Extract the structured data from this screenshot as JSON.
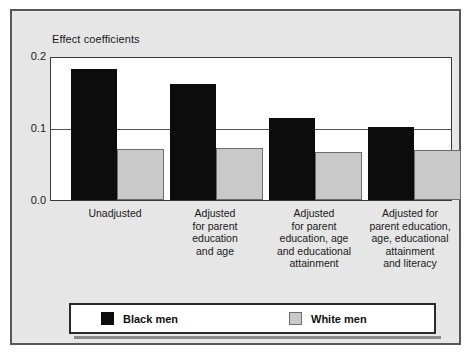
{
  "chart_data": {
    "type": "bar",
    "title": "",
    "ylabel": "Effect coefficients",
    "xlabel": "",
    "ylim": [
      0.0,
      0.2
    ],
    "yticks": [
      "0.2",
      "0.1",
      "0.0"
    ],
    "ytick_values": [
      0.2,
      0.1,
      0.0
    ],
    "grid": true,
    "legend_position": "bottom",
    "categories": [
      "Unadjusted",
      "Adjusted\nfor parent\neducation\nand age",
      "Adjusted\nfor parent\neducation, age\nand educational\nattainment",
      "Adjusted for\nparent education,\nage, educational\nattainment\nand literacy"
    ],
    "series": [
      {
        "name": "Black men",
        "color": "#0c0c0c",
        "values": [
          0.184,
          0.164,
          0.115,
          0.103
        ]
      },
      {
        "name": "White men",
        "color": "#c9c9c9",
        "values": [
          0.072,
          0.074,
          0.068,
          0.071
        ]
      }
    ]
  },
  "legend": {
    "items": [
      {
        "label": "Black men",
        "swatch": "black"
      },
      {
        "label": "White men",
        "swatch": "gray"
      }
    ]
  },
  "colors": {
    "black_series": "#0c0c0c",
    "gray_series": "#c9c9c9",
    "plate_background": "#e6e6e6",
    "frame_border": "#58585a",
    "plot_background": "#ffffff",
    "text": "#1a1a1a"
  }
}
